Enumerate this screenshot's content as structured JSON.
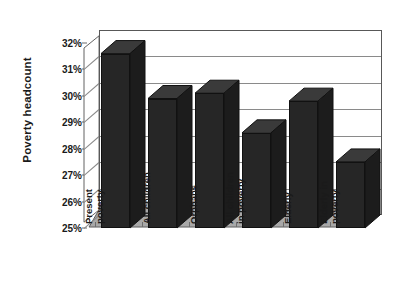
{
  "chart_data": {
    "type": "bar",
    "title": "",
    "subtitle": "",
    "xlabel": "",
    "ylabel": "Poverty headcount",
    "categories": [
      "Present poverty",
      "All children",
      "Orphans",
      "All children in poverty",
      "Elderly",
      "Elderly in poverty"
    ],
    "category_lines": [
      [
        "Present",
        "poverty"
      ],
      [
        "All children"
      ],
      [
        "Orphans"
      ],
      [
        "All children",
        "in poverty"
      ],
      [
        "Elderly"
      ],
      [
        "Elderly in",
        "poverty"
      ]
    ],
    "values": [
      31.6,
      29.9,
      30.1,
      28.6,
      29.8,
      27.5
    ],
    "value_labels": [
      "31.6%",
      "29.9%",
      "30.1%",
      "28.6%",
      "29.8%",
      "27.5%"
    ],
    "ylim": [
      25,
      32
    ],
    "ytick_values": [
      25,
      26,
      27,
      28,
      29,
      30,
      31,
      32
    ],
    "ytick_labels": [
      "25%",
      "26%",
      "27%",
      "28%",
      "29%",
      "30%",
      "31%",
      "32%"
    ],
    "grid": true,
    "legend": false,
    "legend_position": "none",
    "style": "3d-column",
    "colors": {
      "bar_fill": "#262626",
      "bar_texture": "#4a4a4a",
      "bar_outline": "#111111",
      "plot_background": "#ffffff",
      "gridline": "#8a8a8a",
      "axis_line": "#585858",
      "floor_fill": "#a8a8a8",
      "side_wall_fill": "#ffffff",
      "text": "#1a1a1a"
    }
  }
}
